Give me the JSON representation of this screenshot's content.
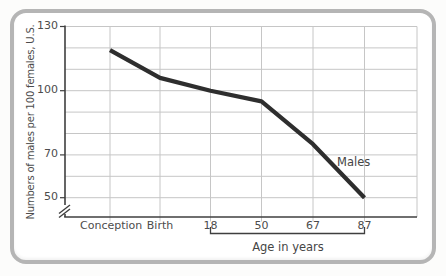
{
  "chart_data": {
    "type": "line",
    "title": "",
    "categories": [
      "Conception",
      "Birth",
      "18",
      "50",
      "67",
      "87"
    ],
    "series": [
      {
        "name": "Males",
        "values": [
          119,
          106,
          100,
          95,
          75,
          50
        ]
      }
    ],
    "ylabel": "Numbers of males per 100 females, U.S.",
    "xlabel": "Age in years",
    "ylim": [
      50,
      130
    ],
    "y_tick_labels": [
      "130",
      "100",
      "70",
      "50"
    ],
    "grid": true,
    "grid_step": 10,
    "y_axis_break": true,
    "x_bracket": {
      "from_category": "18",
      "to_category": "87",
      "label": "Age in years"
    },
    "legend_position": "inline-right-of-line",
    "colors": {
      "line": "#2e2e2e",
      "grid": "#c6c6c6",
      "axis": "#3f3f3f",
      "text": "#4c4c4c",
      "frame_border": "#b5b5b5",
      "background": "#ffffff"
    }
  }
}
